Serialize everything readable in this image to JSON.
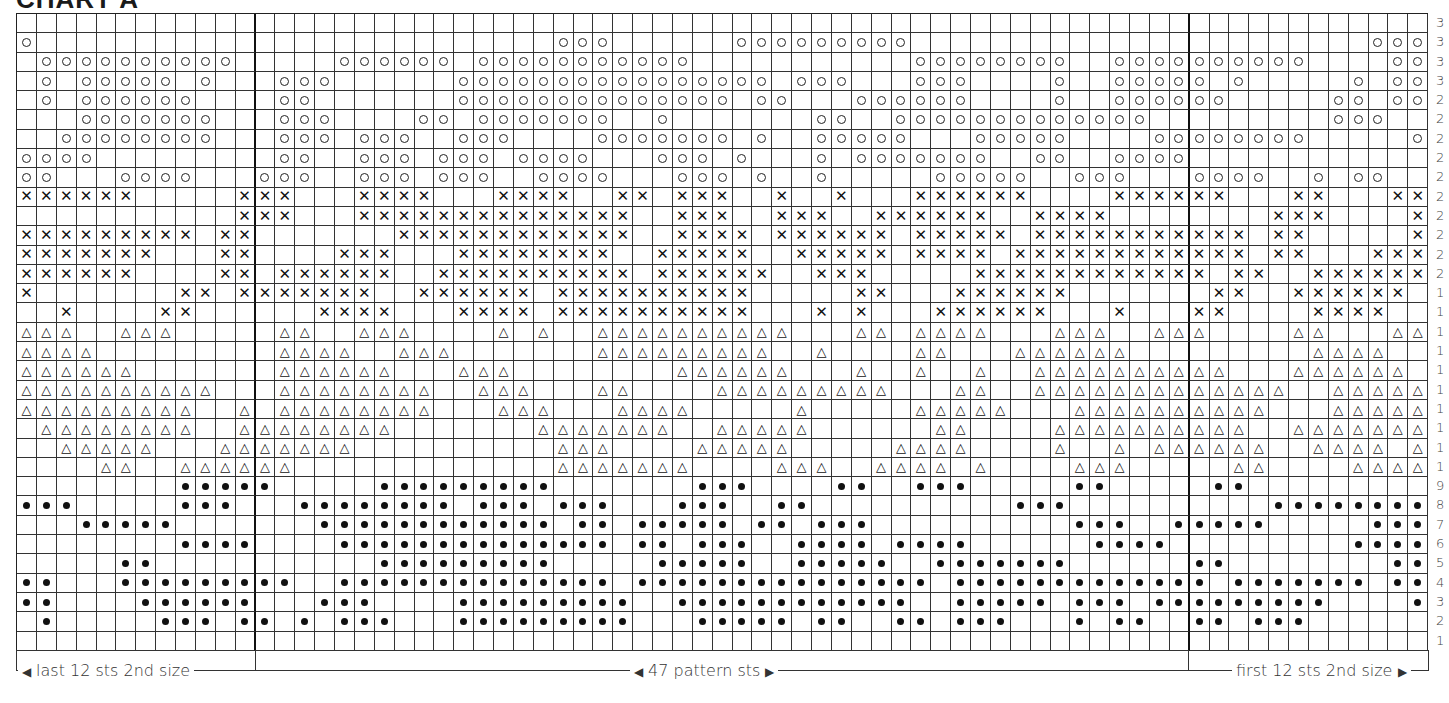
{
  "title": "CHART A",
  "chart_data": {
    "type": "table",
    "title": "CHART A",
    "columns": 71,
    "rows": 33,
    "section_separators_after_columns": [
      12,
      59
    ],
    "legend_symbols": {
      ".": "blank",
      "o": "open-circle",
      "x": "cross",
      "t": "triangle",
      "d": "filled-dot"
    },
    "row_labels_visible": [
      "3",
      "3",
      "3",
      "3",
      "2",
      "2",
      "2",
      "2",
      "2",
      "2",
      "2",
      "2",
      "2",
      "2",
      "1",
      "1",
      "1",
      "1",
      "1",
      "1",
      "1",
      "1",
      "1",
      "1",
      "9",
      "8",
      "7",
      "6",
      "5",
      "4",
      "3",
      "2",
      "1"
    ],
    "grid_top_to_bottom": [
      ".......................................................................",
      "o..........................ooo......ooooooooo.......................ooo....o",
      ".oooooooooo.....oooooo.ooooooooooo...........oooooooo..oooooooooo....oooooo.oo",
      ".o.ooooo.o...ooo......oooooooooooooooo.ooo...ooo....o..ooooo.o.....o.ooo....oooooo",
      ".o.oooooo....oo.......oooooooooooooo.oo...oooooo....o..oooooo.....oo.oo.....ooooo",
      "...ooooooo...ooo....oo.ooooooo..o.......oo..ooooooooooooo.........ooo....oo...o",
      "..oooooooo...ooo.ooo..ooo....ooooooo.o..ooooo...ooooo....oooooooo.....ooo.ooo..oo",
      "oooo.........oo..ooo.ooo.oooo...ooo.o...o.ooooooo..oo..oooo............oo..ooo.oo",
      "oo...oooo...ooo..ooo.ooo..oooo...ooo.o..o.....ooooo..ooo...oooo..o.oo..ooo.oo",
      "xxxxxx.....xxx...xxxx...xxxx..xx.xxx..x..x...xxxxxx....xxxxxx...xx...xxxx...x",
      "...........xxx...xxxxxxxxxxxxxx..xxx..xxx..xxxxxx..xxxx........xxx....xxxxxxxxx",
      "xxxxxxxxx.xx.......xxxxxxxxxxxx..xxxx.xxxxxx.xxxxx.xxxxxxxxxxx.xx.....xxxxxx",
      "xxxxxxx...xx....xxx...xxxxxxxx..xxxxx..xxxxx.xxxx.xxxxxxxxxxxx.xx...xxx..xxxxx",
      "xxxxxx....xx.xxxxxx..xxxxxxxxxx.xxxxxx..xxx.....xxxxxxxxxxxx.xx..xxxxxxxx..xxx",
      "x.......xx.xxxxxxx..xxxxxx.xxxxxxxxxx.....xx...xxxxxx.......xx..xxxxxx...xx",
      "..x....xx......xxxx...xxxx.xxxxxxxxxx...x.x...xxxxxx...x...xx....xxxx...xx",
      "ttt..ttt.....tt..ttt....t.t..tttttttttt...tt.tttt...ttt..ttt....tt...ttt..t",
      "tttt.........tttt..ttt.......ttttttttt..t....tt...tttttt.........tttt..ttt",
      "tttttt.......tttttt...ttt........tttttt...t..t..t..tttttttttt...tttttt...ttt",
      "tttttttttt...tttttttt..ttt...tt....ttttttttt...tt..ttttttttttttt..tttttttt..tt.",
      "ttttttttt..t.tttttttt...ttt...tttt.....t.....ttttt...tttttttttt...tttttttt..tt",
      ".tttttttt..tttttttt.......ttttttt..ttttt......tt....tttttttttt..ttttttttt.....",
      "..ttttt...ttttttt..........ttt....ttttt.....tttt....t..t.tttttt..tttt.ttt....t",
      "....tt..tttttt.............ttttttt....ttt..tttt.t....ttt.....tt....tttttttt..tt",
      "........ddddd.....ddddddddd.......ddd....dd..ddd.....dd.....dd..........ddddddd..",
      "ddd.....ddd...dddddddd.ddd.ddd...ddd..dd..........ddd..........ddddddddd.dd",
      "...ddddd.......dddddddddddd.dd.ddddd.dd.ddd..........ddd..ddddd.....ddddddddddd.dd",
      "........dddd....dddddddddddddd.dd.ddd..dddd.dddd......dddd.........dddd..ddddddddd.dd",
      ".....dd...........ddddddddd.....ddddd..ddddd..ddddddd......dd........ddddddd",
      "dd...ddddddddd..dddddddddddddd.ddddddddddddddd.ddddddddddddd.ddddddd.dddddddddd..ddddd",
      "dd....dddddd...ddd....ddddddddd..dddddddddddd..ddddd.ddd.ddddddddd....ddd.ddddddddddd",
      ".d.....ddd.dd.d.ddd...ddddddddd...ddddd.dd..dd.ddd...d.dd..dd.ddd.......dd..dddd.ddddd",
      "......................................................................."
    ]
  },
  "labels": {
    "left_bracket": "last 12 sts 2nd size",
    "center_bracket": "47 pattern sts",
    "right_bracket": "first 12 sts 2nd size"
  }
}
